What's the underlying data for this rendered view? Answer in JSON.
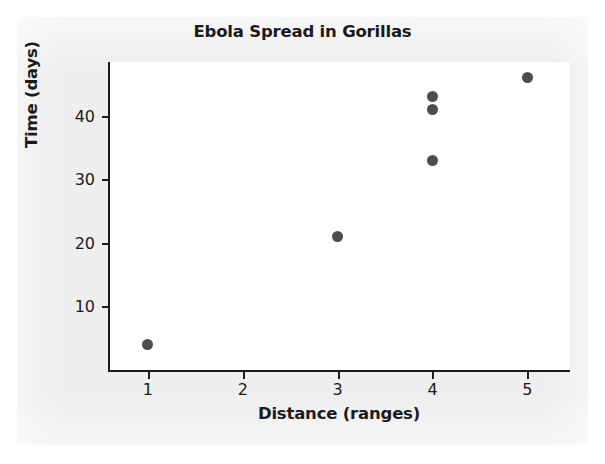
{
  "chart_data": {
    "type": "scatter",
    "title": "Ebola Spread in Gorillas",
    "xlabel": "Distance (ranges)",
    "ylabel": "Time (days)",
    "xlim": [
      0.6,
      5.45
    ],
    "ylim": [
      0,
      48.5
    ],
    "xticks": [
      1,
      2,
      3,
      4,
      5
    ],
    "xtick_labels": [
      "1",
      "2",
      "3",
      "4",
      "5"
    ],
    "yticks": [
      10,
      20,
      30,
      40
    ],
    "ytick_labels": [
      "10",
      "20",
      "30",
      "40"
    ],
    "grid": false,
    "legend": false,
    "marker_color": "#4d4d4d",
    "marker_shape": "circle",
    "points": [
      {
        "x": 1,
        "y": 4
      },
      {
        "x": 3,
        "y": 21
      },
      {
        "x": 4,
        "y": 33
      },
      {
        "x": 4,
        "y": 41
      },
      {
        "x": 4,
        "y": 43
      },
      {
        "x": 5,
        "y": 46
      }
    ]
  },
  "colors": {
    "panel_background": "#eeeeee",
    "plot_background": "#ffffff",
    "axis": "#1c1c1c",
    "text": "#1b1b1b",
    "marker": "#4d4d4d"
  }
}
